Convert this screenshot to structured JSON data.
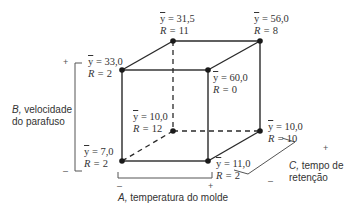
{
  "diagram": {
    "type": "cube-design-2^3",
    "vertices": [
      {
        "id": "a-b+c-",
        "position": "front-top-left",
        "y_mean": "33,0",
        "R": "2"
      },
      {
        "id": "a+b+c-",
        "position": "front-top-right",
        "y_mean": "60,0",
        "R": "0"
      },
      {
        "id": "a-b+c+",
        "position": "back-top-left",
        "y_mean": "31,5",
        "R": "11"
      },
      {
        "id": "a+b+c+",
        "position": "back-top-right",
        "y_mean": "56,0",
        "R": "8"
      },
      {
        "id": "a-b-c-",
        "position": "front-bottom-left",
        "y_mean": "7,0",
        "R": "2"
      },
      {
        "id": "a+b-c-",
        "position": "front-bottom-right",
        "y_mean": "11,0",
        "R": "2"
      },
      {
        "id": "a-b-c+",
        "position": "back-bottom-left",
        "y_mean": "10,0",
        "R": "12"
      },
      {
        "id": "a+b-c+",
        "position": "back-bottom-right",
        "y_mean": "10,0",
        "R": "10"
      }
    ],
    "ybar_symbol": "y",
    "eq": " = ",
    "r_prefix": "R = ",
    "axes": {
      "A": {
        "letter": "A,",
        "label": " temperatura do molde",
        "minus": "–",
        "plus": "+"
      },
      "B": {
        "letter": "B,",
        "label_line1": " velocidade",
        "label_line2": "do parafuso",
        "minus": "–",
        "plus": "+"
      },
      "C": {
        "letter": "C,",
        "label_line1": " tempo de",
        "label_line2": "retenção",
        "minus": "–",
        "plus": "+"
      }
    },
    "colors": {
      "line": "#2a2a2a",
      "dot": "#1a1a1a",
      "bracket": "#555555"
    }
  }
}
